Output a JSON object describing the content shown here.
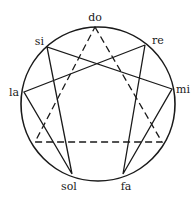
{
  "diagram": {
    "type": "enneagram",
    "stroke_color": "#1a1a1a",
    "background": "#ffffff",
    "circle": {
      "cx": 98,
      "cy": 104,
      "r": 77
    },
    "points": {
      "do": {
        "label": "do",
        "x": 95,
        "y": 27
      },
      "re": {
        "label": "re",
        "x": 145,
        "y": 45
      },
      "mi": {
        "label": "mi",
        "x": 172,
        "y": 89
      },
      "fa": {
        "label": "fa",
        "x": 123,
        "y": 174
      },
      "sol": {
        "label": "sol",
        "x": 72,
        "y": 174
      },
      "la": {
        "label": "la",
        "x": 24,
        "y": 92
      },
      "si": {
        "label": "si",
        "x": 47,
        "y": 47
      },
      "p3": {
        "label": "",
        "x": 162,
        "y": 142
      },
      "p6": {
        "label": "",
        "x": 35,
        "y": 142
      }
    },
    "labels": {
      "do": "do",
      "re": "re",
      "mi": "mi",
      "fa": "fa",
      "sol": "sol",
      "la": "la",
      "si": "si"
    },
    "solid_path": [
      "re",
      "fa",
      "mi",
      "si",
      "sol",
      "la",
      "re"
    ],
    "dashed_triangle": [
      "do",
      "p3",
      "p6",
      "do"
    ]
  }
}
